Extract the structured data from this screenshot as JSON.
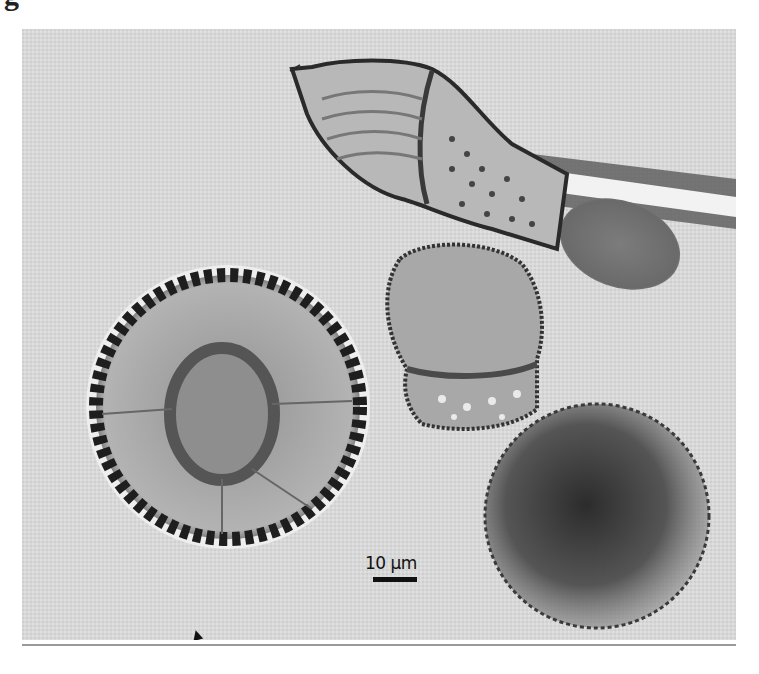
{
  "figure": {
    "label_fragment": "g",
    "scale_bar": {
      "label": "10 µm",
      "length_px": 44
    },
    "arrowhead_marker": "arrowhead-icon",
    "specimens": [
      {
        "name": "flask-shaped-cyst",
        "description": "elongate ornamented cyst with attached tube"
      },
      {
        "name": "spiny-round-cyst",
        "description": "large spherical cyst with spiny wall"
      },
      {
        "name": "truncated-round-cyst",
        "description": "medium cyst with granular lower end"
      },
      {
        "name": "dark-round-cyst",
        "description": "dark spherical cyst with beaded margin"
      },
      {
        "name": "ovoid-body",
        "description": "smooth ovoid body beneath tube"
      }
    ],
    "colors": {
      "background": "#d9d9d9",
      "dark": "#1e1e1e",
      "mid": "#7a7a7a"
    }
  }
}
